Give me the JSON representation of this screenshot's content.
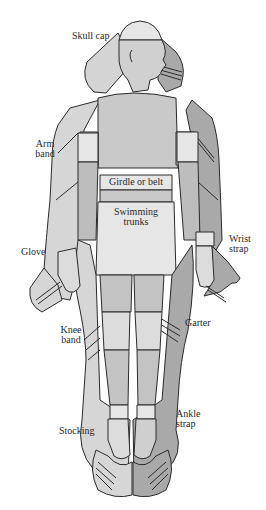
{
  "diagram": {
    "colors": {
      "skin_light": "#d8d8d8",
      "skin_mid": "#c6c6c6",
      "shadow_dark": "#a9a9a9",
      "band_light": "#e6e6e6",
      "outline": "#2b2b2b",
      "background": "#ffffff",
      "text": "#2a2a2a"
    },
    "labels": {
      "skull_cap": "Skull cap",
      "arm_band_line1": "Arm",
      "arm_band_line2": "band",
      "girdle": "Girdle or belt",
      "trunks_line1": "Swimming",
      "trunks_line2": "trunks",
      "wrist_line1": "Wrist",
      "wrist_line2": "strap",
      "glove": "Glove",
      "knee_line1": "Knee",
      "knee_line2": "band",
      "garter": "Garter",
      "stocking": "Stocking",
      "ankle_line1": "Ankle",
      "ankle_line2": "strap"
    }
  }
}
